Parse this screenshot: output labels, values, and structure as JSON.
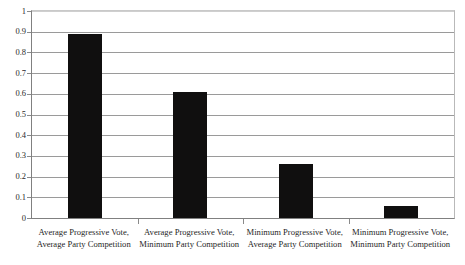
{
  "chart_data": {
    "type": "bar",
    "title": "",
    "subtitle": "",
    "xlabel": "",
    "ylabel": "",
    "categories": [
      "Average Progressive Vote, Average Party Competition",
      "Average Progressive Vote, Minimum Party Competition",
      "Minimum Progressive Vote, Average Party Competition",
      "Minimum Progressive Vote, Minimum Party Competition"
    ],
    "category_lines": [
      [
        "Average Progressive Vote,",
        "Average Party Competition"
      ],
      [
        "Average Progressive Vote,",
        "Minimum Party Competition"
      ],
      [
        "Minimum Progressive Vote,",
        "Average Party Competition"
      ],
      [
        "Minimum Progressive Vote,",
        "Minimum Party Competition"
      ]
    ],
    "values": [
      0.89,
      0.61,
      0.26,
      0.06
    ],
    "ylim": [
      0,
      1
    ],
    "ytick_values": [
      0,
      0.1,
      0.2,
      0.3,
      0.4,
      0.5,
      0.6,
      0.7,
      0.8,
      0.9,
      1
    ],
    "ytick_labels": [
      "0",
      "0.1",
      "0.2",
      "0.3",
      "0.4",
      "0.5",
      "0.6",
      "0.7",
      "0.8",
      "0.9",
      "1"
    ],
    "grid": true,
    "legend": false,
    "bar_color": "#100f0f",
    "gridline_color": "#9a9a9a",
    "axis_color": "#808080",
    "background_color": "#ffffff"
  }
}
